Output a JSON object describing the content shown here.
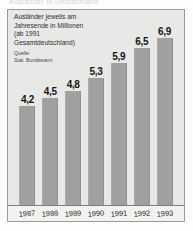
{
  "headline": "Ausländer in Deutschland",
  "panel": {
    "caption": "Ausländer jeweils am\nJahresende in Millionen\n(ab 1991\nGesamtdeutschland)",
    "source": "Quelle:\nStat. Bundesamt"
  },
  "colors": {
    "bar": "#a0a09e",
    "panel_background": "#e8e8e6",
    "border": "#9a9a98",
    "text": "#161616"
  },
  "chart_data": {
    "type": "bar",
    "title": "Ausländer jeweils am Jahresende in Millionen (ab 1991 Gesamtdeutschland)",
    "xlabel": "",
    "ylabel": "Millionen",
    "source": "Quelle: Stat. Bundesamt",
    "grid": false,
    "legend": "none",
    "baseline_suppressed": true,
    "ylim": [
      0,
      7.4
    ],
    "categories": [
      "1987",
      "1988",
      "1989",
      "1990",
      "1991",
      "1992",
      "1993"
    ],
    "values": [
      4.2,
      4.5,
      4.8,
      5.3,
      5.9,
      6.5,
      6.9
    ],
    "value_labels": [
      "4,2",
      "4,5",
      "4,8",
      "5,3",
      "5,9",
      "6,5",
      "6,9"
    ],
    "bars": [
      {
        "year": "1987",
        "value": 4.2,
        "label": "4,2"
      },
      {
        "year": "1988",
        "value": 4.5,
        "label": "4,5"
      },
      {
        "year": "1989",
        "value": 4.8,
        "label": "4,8"
      },
      {
        "year": "1990",
        "value": 5.3,
        "label": "5,3"
      },
      {
        "year": "1991",
        "value": 5.9,
        "label": "5,9"
      },
      {
        "year": "1992",
        "value": 6.5,
        "label": "6,5"
      },
      {
        "year": "1993",
        "value": 6.9,
        "label": "6,9"
      }
    ]
  }
}
